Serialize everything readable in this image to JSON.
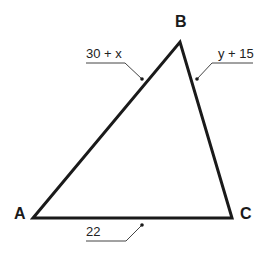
{
  "diagram": {
    "type": "triangle",
    "vertices": [
      {
        "name": "A",
        "x": 33,
        "y": 218
      },
      {
        "name": "B",
        "x": 180,
        "y": 42
      },
      {
        "name": "C",
        "x": 232,
        "y": 218
      }
    ],
    "vertex_labels": {
      "A": "A",
      "B": "B",
      "C": "C"
    },
    "side_labels": {
      "AB": "30 + x",
      "BC": "y + 15",
      "AC": "22"
    },
    "colors": {
      "stroke": "#1a1a1a",
      "leader": "#444444",
      "background": "#ffffff"
    }
  }
}
